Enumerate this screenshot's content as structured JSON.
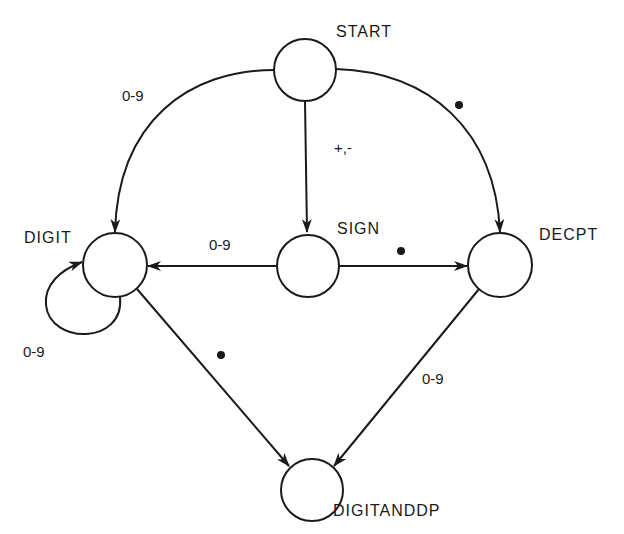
{
  "diagram": {
    "type": "finite-state-machine",
    "nodes": [
      {
        "id": "start",
        "label": "START"
      },
      {
        "id": "sign",
        "label": "SIGN"
      },
      {
        "id": "digit",
        "label": "DIGIT"
      },
      {
        "id": "decpt",
        "label": "DECPT"
      },
      {
        "id": "digitanddp",
        "label": "DIGITANDDP"
      }
    ],
    "edges": [
      {
        "from": "START",
        "to": "DIGIT",
        "label": "0-9"
      },
      {
        "from": "START",
        "to": "SIGN",
        "label": "+,-"
      },
      {
        "from": "START",
        "to": "DECPT",
        "label": "•"
      },
      {
        "from": "SIGN",
        "to": "DIGIT",
        "label": "0-9"
      },
      {
        "from": "SIGN",
        "to": "DECPT",
        "label": "•"
      },
      {
        "from": "DIGIT",
        "to": "DIGIT",
        "label": "0-9"
      },
      {
        "from": "DIGIT",
        "to": "DIGITANDDP",
        "label": "•"
      },
      {
        "from": "DECPT",
        "to": "DIGITANDDP",
        "label": "0-9"
      }
    ]
  },
  "labels": {
    "start": "START",
    "sign": "SIGN",
    "digit": "DIGIT",
    "decpt": "DECPT",
    "digitanddp": "DIGITANDDP",
    "edge_start_digit": "0-9",
    "edge_start_sign": "+,-",
    "edge_sign_digit": "0-9",
    "edge_digit_self": "0-9",
    "edge_decpt_digitanddp": "0-9"
  }
}
